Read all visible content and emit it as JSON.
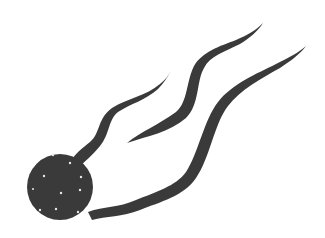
{
  "image": {
    "subject": "comet",
    "description": "Black-and-white clip art of a comet: a dark speckled sphere with three wavy tapered tails streaming to the upper right",
    "colors": {
      "background": "#ffffff",
      "ink": "#3a3a3a",
      "speckle": "#e8e8e8"
    },
    "parts": {
      "nucleus": "comet-nucleus",
      "tails": [
        "tail-upper",
        "tail-middle",
        "tail-lower"
      ],
      "speckle_count": 10
    }
  }
}
